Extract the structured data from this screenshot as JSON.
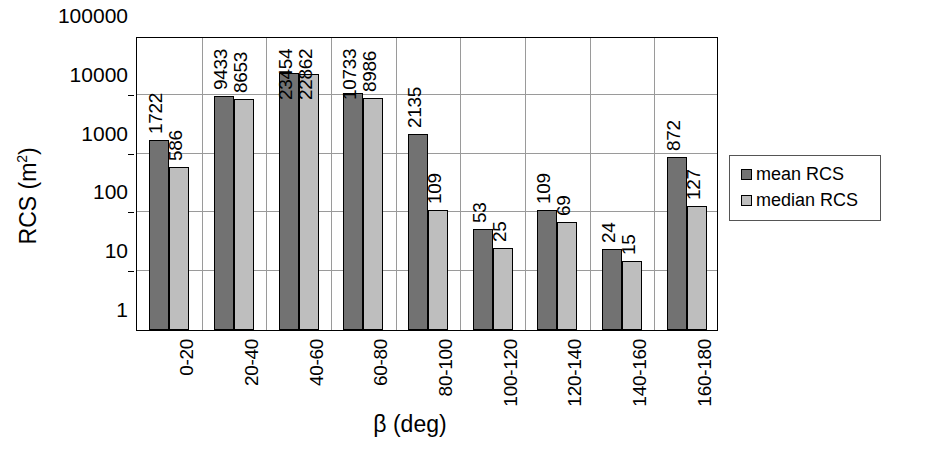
{
  "chart_data": {
    "type": "bar",
    "title": "",
    "xlabel": "β (deg)",
    "ylabel": "RCS (m²)",
    "yscale": "log",
    "ylim": [
      1,
      100000
    ],
    "ytick_labels": [
      "100000",
      "10000",
      "1000",
      "100",
      "10",
      "1"
    ],
    "ytick_values": [
      100000,
      10000,
      1000,
      100,
      10,
      1
    ],
    "grid": true,
    "legend_position": "right",
    "categories": [
      "0-20",
      "20-40",
      "40-60",
      "60-80",
      "80-100",
      "100-120",
      "120-140",
      "140-160",
      "160-180"
    ],
    "series": [
      {
        "name": "mean RCS",
        "color": "#727272",
        "values": [
          1722,
          9433,
          23454,
          10733,
          2135,
          53,
          109,
          24,
          872
        ]
      },
      {
        "name": "median RCS",
        "color": "#bebebe",
        "values": [
          586,
          8653,
          22862,
          8986,
          109,
          25,
          69,
          15,
          127
        ]
      }
    ]
  },
  "axes": {
    "y_title_main": "RCS (m",
    "y_title_sup": "2",
    "y_title_close": ")",
    "x_title": "β (deg)"
  },
  "legend": {
    "items": [
      {
        "label": "mean RCS",
        "color": "#727272"
      },
      {
        "label": "median RCS",
        "color": "#bebebe"
      }
    ]
  }
}
